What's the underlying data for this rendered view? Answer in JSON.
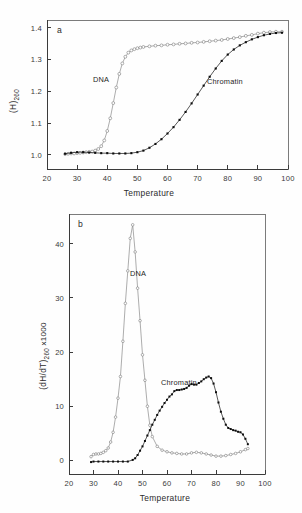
{
  "figure": {
    "panel_a_letter": "a",
    "panel_b_letter": "b"
  },
  "panel_a": {
    "letter": "a",
    "xlabel": "Temperature",
    "ylabel_main": "(H)",
    "ylabel_sub": "260",
    "xticks": [
      "20",
      "30",
      "40",
      "50",
      "60",
      "70",
      "80",
      "90",
      "100"
    ],
    "yticks": [
      "1.0",
      "1.1",
      "1.2",
      "1.3",
      "1.4"
    ],
    "label_dna": "DNA",
    "label_chromatin": "Chromatin"
  },
  "panel_b": {
    "letter": "b",
    "xlabel": "Temperature",
    "ylabel_main": "(dH/dT)",
    "ylabel_sub": "260",
    "ylabel_tail": " x1000",
    "xticks": [
      "20",
      "30",
      "40",
      "50",
      "60",
      "70",
      "80",
      "90",
      "100"
    ],
    "yticks": [
      "0",
      "10",
      "20",
      "30",
      "40"
    ],
    "label_dna": "DNA",
    "label_chromatin": "Chromatin"
  },
  "colors": {
    "dna_marker_edge": "#6f6f6f",
    "dna_marker_fill": "#ffffff",
    "chromatin_marker": "#0d0d0d",
    "axis": "#3b3b3b",
    "background": "#ffffff"
  },
  "chart_data": [
    {
      "type": "line",
      "id": "panel-a",
      "title": "a",
      "xlabel": "Temperature",
      "ylabel": "(H)260",
      "xlim": [
        20,
        100
      ],
      "ylim": [
        0.955,
        1.425
      ],
      "xticks": [
        20,
        30,
        40,
        50,
        60,
        70,
        80,
        90,
        100
      ],
      "yticks": [
        1.0,
        1.1,
        1.2,
        1.3,
        1.4
      ],
      "grid": false,
      "legend": "inline-annotations",
      "series": [
        {
          "name": "DNA",
          "marker": "open-circle",
          "x": [
            26,
            27,
            28,
            29,
            30,
            31,
            32,
            33,
            34,
            35,
            36,
            37,
            38,
            39,
            40,
            41,
            42,
            43,
            44,
            45,
            46,
            47,
            48,
            49,
            50,
            51,
            52,
            54,
            56,
            58,
            60,
            62,
            64,
            66,
            68,
            70,
            72,
            74,
            76,
            78,
            80,
            82,
            84,
            86,
            88,
            90,
            92,
            94,
            96,
            98
          ],
          "y": [
            1.002,
            1.003,
            1.004,
            1.004,
            1.005,
            1.006,
            1.007,
            1.008,
            1.009,
            1.01,
            1.013,
            1.018,
            1.027,
            1.045,
            1.075,
            1.115,
            1.163,
            1.212,
            1.255,
            1.288,
            1.309,
            1.322,
            1.329,
            1.333,
            1.336,
            1.338,
            1.34,
            1.342,
            1.344,
            1.345,
            1.347,
            1.348,
            1.35,
            1.351,
            1.353,
            1.354,
            1.356,
            1.358,
            1.36,
            1.362,
            1.365,
            1.368,
            1.371,
            1.375,
            1.378,
            1.382,
            1.385,
            1.387,
            1.388,
            1.388
          ]
        },
        {
          "name": "Chromatin",
          "marker": "filled-square",
          "x": [
            26,
            28,
            30,
            32,
            34,
            36,
            38,
            40,
            42,
            44,
            46,
            48,
            50,
            52,
            54,
            56,
            58,
            60,
            62,
            64,
            66,
            68,
            70,
            72,
            74,
            76,
            78,
            80,
            82,
            84,
            86,
            88,
            90,
            92,
            94,
            96,
            98
          ],
          "y": [
            1.003,
            1.006,
            1.008,
            1.008,
            1.007,
            1.006,
            1.005,
            1.005,
            1.004,
            1.004,
            1.004,
            1.005,
            1.008,
            1.013,
            1.022,
            1.034,
            1.049,
            1.067,
            1.087,
            1.11,
            1.135,
            1.162,
            1.19,
            1.218,
            1.246,
            1.272,
            1.296,
            1.316,
            1.332,
            1.345,
            1.355,
            1.364,
            1.371,
            1.377,
            1.381,
            1.384,
            1.385
          ]
        }
      ]
    },
    {
      "type": "line",
      "id": "panel-b",
      "title": "b",
      "xlabel": "Temperature",
      "ylabel": "(dH/dT)260 x1000",
      "xlim": [
        20,
        100
      ],
      "ylim": [
        -2.5,
        45.5
      ],
      "xticks": [
        20,
        30,
        40,
        50,
        60,
        70,
        80,
        90,
        100
      ],
      "yticks": [
        0,
        10,
        20,
        30,
        40
      ],
      "grid": false,
      "legend": "inline-annotations",
      "series": [
        {
          "name": "DNA",
          "marker": "open-circle",
          "x": [
            29,
            30,
            31,
            32,
            33,
            34,
            35,
            36,
            37,
            38,
            39,
            40,
            41,
            42,
            43,
            44,
            45,
            46,
            47,
            48,
            49,
            50,
            51,
            52,
            53,
            54,
            56,
            58,
            60,
            62,
            64,
            66,
            68,
            70,
            72,
            74,
            76,
            78,
            80,
            82,
            84,
            86,
            88,
            90,
            92,
            93
          ],
          "y": [
            0.7,
            1.1,
            1.2,
            1.2,
            1.3,
            1.5,
            1.8,
            2.3,
            3.4,
            5.2,
            8.0,
            11.5,
            15.5,
            22.0,
            29.0,
            35.0,
            41.0,
            43.5,
            38.5,
            31.8,
            25.8,
            19.5,
            14.8,
            10.0,
            6.5,
            4.4,
            2.6,
            1.9,
            1.6,
            1.4,
            1.3,
            1.2,
            1.2,
            1.4,
            1.5,
            1.4,
            1.2,
            1.0,
            0.8,
            0.8,
            0.9,
            1.1,
            1.3,
            1.6,
            2.0,
            2.2
          ]
        },
        {
          "name": "Chromatin",
          "marker": "filled-square",
          "x": [
            29,
            30,
            32,
            34,
            36,
            38,
            40,
            42,
            44,
            46,
            47,
            48,
            49,
            50,
            51,
            52,
            53,
            54,
            55,
            56,
            57,
            58,
            59,
            60,
            61,
            62,
            63,
            64,
            65,
            66,
            67,
            68,
            69,
            70,
            71,
            72,
            73,
            74,
            75,
            76,
            77,
            78,
            79,
            80,
            81,
            82,
            83,
            84,
            85,
            86,
            87,
            88,
            89,
            90,
            91,
            92,
            93
          ],
          "y": [
            -0.3,
            -0.2,
            -0.2,
            -0.2,
            -0.2,
            -0.2,
            -0.2,
            -0.2,
            -0.2,
            0.1,
            0.4,
            1.0,
            1.8,
            2.6,
            3.6,
            4.6,
            5.6,
            6.6,
            7.5,
            8.4,
            9.2,
            9.9,
            10.6,
            11.2,
            11.8,
            12.2,
            12.8,
            13.0,
            13.0,
            13.1,
            13.2,
            13.4,
            13.8,
            14.1,
            14.0,
            14.0,
            14.3,
            14.6,
            15.0,
            15.3,
            15.5,
            15.2,
            14.2,
            12.6,
            10.7,
            9.0,
            7.7,
            6.6,
            6.0,
            5.8,
            5.6,
            5.5,
            5.3,
            5.2,
            4.8,
            4.0,
            3.0
          ]
        }
      ]
    }
  ]
}
